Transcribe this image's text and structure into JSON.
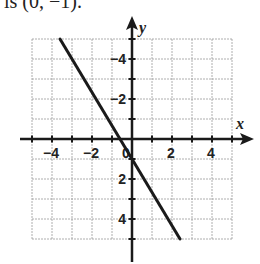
{
  "caption": "is (0, −1).",
  "chart_data": {
    "type": "line",
    "title": "",
    "xlabel": "x",
    "ylabel": "y",
    "xlim": [
      -5,
      5
    ],
    "ylim": [
      -5,
      5
    ],
    "grid": true,
    "grid_step": 1,
    "x_ticks": [
      -4,
      -2,
      0,
      2,
      4
    ],
    "y_ticks": [
      -4,
      -2,
      2,
      4
    ],
    "x_tick_labels": [
      "−4",
      "−2",
      "0",
      "2",
      "4"
    ],
    "y_tick_labels": [
      "4",
      "2",
      "−2",
      "−4"
    ],
    "series": [
      {
        "name": "line",
        "equation": "y = -(5/3)x - 1",
        "x": [
          -3.6,
          2.4
        ],
        "y": [
          5,
          -5
        ]
      }
    ],
    "intercepts": {
      "x": -0.6,
      "y": -1
    }
  },
  "colors": {
    "grid": "#9a9a9a",
    "axis": "#1a1a1a",
    "line": "#1a1a1a"
  }
}
